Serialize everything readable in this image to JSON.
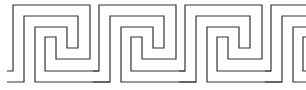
{
  "pattern": {
    "name": "Greek key meander border",
    "width": 306,
    "height": 90,
    "background": "#ffffff",
    "stroke_color": "#333333",
    "origin_x": 13,
    "period": 86,
    "repeats": 4,
    "path_a": [
      [
        -6,
        71
      ],
      [
        0,
        71
      ],
      [
        0,
        5
      ],
      [
        77,
        5
      ],
      [
        77,
        59
      ],
      [
        43,
        59
      ],
      [
        43,
        37
      ],
      [
        32,
        37
      ],
      [
        32,
        71
      ],
      [
        86,
        71
      ]
    ],
    "path_b": [
      [
        -6,
        82
      ],
      [
        11,
        82
      ],
      [
        11,
        16
      ],
      [
        65,
        16
      ],
      [
        65,
        48
      ],
      [
        54,
        48
      ],
      [
        54,
        27
      ],
      [
        22,
        27
      ],
      [
        22,
        82
      ],
      [
        97,
        82
      ]
    ]
  }
}
